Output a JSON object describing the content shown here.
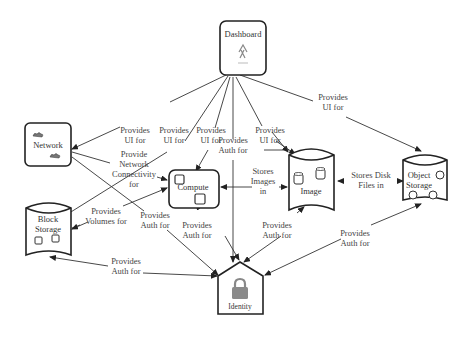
{
  "diagram": {
    "nodes": {
      "dashboard": {
        "label": "Dashboard",
        "shape": "rounded-box",
        "icon": "dashboard-figure-icon"
      },
      "network": {
        "label": "Network",
        "shape": "rounded-box",
        "icon": "network-cloud-icon"
      },
      "compute": {
        "label": "Compute",
        "shape": "rounded-box",
        "icon": "compute-square-icon"
      },
      "image": {
        "label": "Image",
        "shape": "cylinder",
        "icon": "image-disk-icon"
      },
      "object_storage": {
        "label_line1": "Object",
        "label_line2": "Storage",
        "shape": "cylinder",
        "icon": "object-circle-icon"
      },
      "block_storage": {
        "label_line1": "Block",
        "label_line2": "Storage",
        "shape": "cylinder",
        "icon": "block-square-icon"
      },
      "identity": {
        "label": "Identity",
        "shape": "house",
        "icon": "lock-icon"
      }
    },
    "edges": [
      {
        "from": "dashboard",
        "to": "network",
        "label": [
          "Provides",
          "UI for"
        ]
      },
      {
        "from": "dashboard",
        "to": "block_storage",
        "label": [
          "Provides",
          "UI for"
        ]
      },
      {
        "from": "dashboard",
        "to": "compute",
        "label": [
          "Provides",
          "UI for"
        ]
      },
      {
        "from": "dashboard",
        "to": "identity",
        "label": [
          "Provides",
          "Auth for"
        ]
      },
      {
        "from": "dashboard",
        "to": "image",
        "label": [
          "Provides",
          "UI for"
        ]
      },
      {
        "from": "dashboard",
        "to": "object_storage",
        "label": [
          "Provides",
          "UI for"
        ]
      },
      {
        "from": "network",
        "to": "compute",
        "label": [
          "Provide",
          "Network",
          "Connectivity",
          "for"
        ]
      },
      {
        "from": "block_storage",
        "to": "compute",
        "label": [
          "Provides",
          "Volumes for"
        ]
      },
      {
        "from": "network",
        "to": "identity",
        "label": [
          "Provides",
          "Auth for"
        ]
      },
      {
        "from": "compute",
        "to": "identity",
        "label": [
          "Provides",
          "Auth for"
        ]
      },
      {
        "from": "image",
        "to": "compute",
        "label": [
          "Stores",
          "Images",
          "in"
        ]
      },
      {
        "from": "image",
        "to": "object_storage",
        "label": [
          "Stores Disk",
          "Files in"
        ]
      },
      {
        "from": "image",
        "to": "identity",
        "label": [
          "Provides",
          "Auth for"
        ]
      },
      {
        "from": "object_storage",
        "to": "identity",
        "label": [
          "Provides",
          "Auth for"
        ]
      },
      {
        "from": "block_storage",
        "to": "identity",
        "label": [
          "Provides",
          "Auth for"
        ]
      }
    ]
  }
}
